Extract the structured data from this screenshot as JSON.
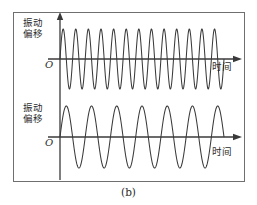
{
  "figure": {
    "caption": "(b)",
    "border_color": "#6f6f6f",
    "background_color": "#ffffff",
    "line_color": "#3a3a3a"
  },
  "panels": [
    {
      "id": "top",
      "y_axis_label_line1": "振动",
      "y_axis_label_line2": "偏移",
      "x_axis_label": "时间",
      "origin_label": "O"
    },
    {
      "id": "bottom",
      "y_axis_label_line1": "振动",
      "y_axis_label_line2": "偏移",
      "x_axis_label": "时间",
      "origin_label": "O"
    }
  ],
  "chart_data": [
    {
      "type": "line",
      "title": "振动偏移 vs 时间 (高频)",
      "xlabel": "时间",
      "ylabel": "振动偏移",
      "waveform": "sine",
      "cycles": 13,
      "amplitude": 30,
      "phase_deg": 0,
      "x_start_px": 46,
      "x_end_px": 210,
      "baseline_px": 46,
      "xlim": [
        0,
        13
      ],
      "ylim": [
        -1,
        1
      ],
      "grid": false,
      "legend": "none"
    },
    {
      "type": "line",
      "title": "振动偏移 vs 时间 (低频)",
      "xlabel": "时间",
      "ylabel": "振动偏移",
      "waveform": "sine",
      "cycles": 6.5,
      "amplitude": 31,
      "phase_deg": 0,
      "x_start_px": 46,
      "x_end_px": 210,
      "baseline_px": 39,
      "xlim": [
        0,
        6.5
      ],
      "ylim": [
        -1,
        1
      ],
      "grid": false,
      "legend": "none"
    }
  ]
}
